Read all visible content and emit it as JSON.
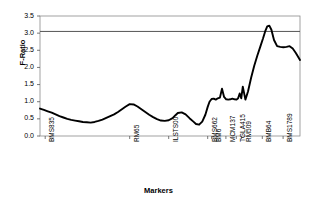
{
  "chart_data": {
    "type": "line",
    "title": "",
    "xlabel": "Markers",
    "ylabel": "F-Ratio",
    "ylim": [
      0.0,
      3.5
    ],
    "yticks": [
      "0.0",
      "0.5",
      "1.0",
      "1.5",
      "2.0",
      "2.5",
      "3.0",
      "3.5"
    ],
    "ytick_values": [
      0.0,
      0.5,
      1.0,
      1.5,
      2.0,
      2.5,
      3.0,
      3.5
    ],
    "grid": false,
    "legend": "none",
    "threshold_line": {
      "value": 3.05,
      "color": "#555555",
      "label": ""
    },
    "line_color": "#000000",
    "marker_labels": [
      {
        "label": "BMS835",
        "x": 0.02
      },
      {
        "label": "RM65",
        "x": 0.345
      },
      {
        "label": "ILSTS00",
        "x": 0.495
      },
      {
        "label": "BMS662",
        "x": 0.645
      },
      {
        "label": "BM6",
        "x": 0.66
      },
      {
        "label": "MCM137",
        "x": 0.715
      },
      {
        "label": "TGLA415",
        "x": 0.755
      },
      {
        "label": "RM509",
        "x": 0.775
      },
      {
        "label": "BMB64",
        "x": 0.855
      },
      {
        "label": "BMS1789",
        "x": 0.935
      }
    ],
    "x": [
      0.0,
      0.015,
      0.03,
      0.045,
      0.06,
      0.075,
      0.09,
      0.105,
      0.12,
      0.135,
      0.15,
      0.165,
      0.18,
      0.195,
      0.21,
      0.225,
      0.24,
      0.255,
      0.27,
      0.285,
      0.3,
      0.315,
      0.33,
      0.345,
      0.36,
      0.375,
      0.39,
      0.405,
      0.42,
      0.435,
      0.45,
      0.465,
      0.48,
      0.495,
      0.51,
      0.52,
      0.53,
      0.545,
      0.56,
      0.575,
      0.59,
      0.6,
      0.612,
      0.624,
      0.636,
      0.645,
      0.652,
      0.66,
      0.668,
      0.676,
      0.684,
      0.692,
      0.7,
      0.708,
      0.716,
      0.724,
      0.732,
      0.74,
      0.748,
      0.756,
      0.762,
      0.768,
      0.774,
      0.78,
      0.79,
      0.8,
      0.812,
      0.824,
      0.836,
      0.848,
      0.858,
      0.866,
      0.874,
      0.882,
      0.89,
      0.9,
      0.912,
      0.924,
      0.936,
      0.948,
      0.96,
      0.972,
      0.984,
      1.0
    ],
    "values": [
      0.8,
      0.76,
      0.72,
      0.68,
      0.63,
      0.58,
      0.54,
      0.5,
      0.47,
      0.45,
      0.43,
      0.41,
      0.4,
      0.39,
      0.41,
      0.44,
      0.48,
      0.53,
      0.58,
      0.63,
      0.7,
      0.78,
      0.86,
      0.93,
      0.92,
      0.86,
      0.78,
      0.7,
      0.62,
      0.55,
      0.49,
      0.45,
      0.44,
      0.46,
      0.52,
      0.6,
      0.67,
      0.69,
      0.63,
      0.52,
      0.42,
      0.35,
      0.33,
      0.42,
      0.62,
      0.85,
      1.0,
      1.08,
      1.09,
      1.06,
      1.1,
      1.12,
      1.38,
      1.14,
      1.07,
      1.06,
      1.07,
      1.09,
      1.07,
      1.06,
      1.1,
      1.24,
      1.1,
      1.44,
      1.06,
      1.3,
      1.7,
      2.05,
      2.35,
      2.62,
      2.85,
      3.05,
      3.2,
      3.22,
      3.1,
      2.8,
      2.62,
      2.6,
      2.59,
      2.6,
      2.62,
      2.55,
      2.42,
      2.22
    ]
  }
}
